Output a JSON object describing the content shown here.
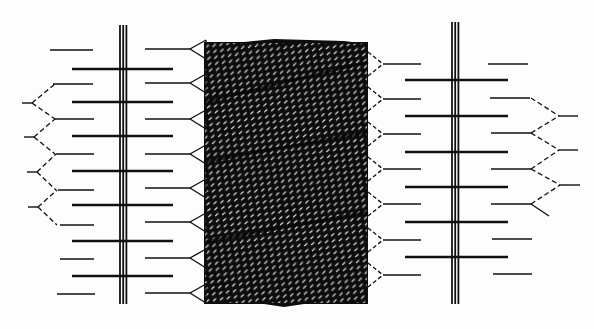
{
  "figure": {
    "width": 594,
    "height": 329,
    "background": "#fdfdfd",
    "ink": "#111111",
    "title": ""
  },
  "spines": [
    {
      "id": "left-spine",
      "x": 120,
      "gap": 3.2,
      "y1": 25,
      "y2": 304
    },
    {
      "id": "right-spine",
      "x": 452,
      "gap": 3.2,
      "y1": 22,
      "y2": 304
    }
  ],
  "core_block": {
    "x": 204,
    "y": 42,
    "width": 164,
    "height": 262,
    "fill": "#0d0d0d",
    "stripe_color": "#e6e6e6"
  },
  "left_thick_bars": {
    "x1": 72,
    "x2": 173,
    "ys": [
      69,
      102,
      136,
      171,
      205,
      241,
      276
    ]
  },
  "left_outer_thin_bars": [
    {
      "x1": 50,
      "x2": 93,
      "y": 50
    },
    {
      "x1": 53,
      "x2": 93,
      "y": 84
    },
    {
      "x1": 55,
      "x2": 94,
      "y": 119
    },
    {
      "x1": 56,
      "x2": 94,
      "y": 154
    },
    {
      "x1": 58,
      "x2": 94,
      "y": 190
    },
    {
      "x1": 60,
      "x2": 94,
      "y": 225
    },
    {
      "x1": 60,
      "x2": 94,
      "y": 259
    },
    {
      "x1": 57,
      "x2": 95,
      "y": 294
    }
  ],
  "left_inner_bars": {
    "x1": 145,
    "x2": 190,
    "ys": [
      49,
      83,
      119,
      154,
      188,
      222,
      258,
      293
    ]
  },
  "left_chevrons": [
    {
      "tip_x": 22,
      "tip_y": 103,
      "top_y": 84,
      "bot_y": 119,
      "open_x": 55
    },
    {
      "tip_x": 24,
      "tip_y": 137,
      "top_y": 119,
      "bot_y": 154,
      "open_x": 55
    },
    {
      "tip_x": 27,
      "tip_y": 172,
      "top_y": 154,
      "bot_y": 190,
      "open_x": 56
    },
    {
      "tip_x": 28,
      "tip_y": 207,
      "top_y": 190,
      "bot_y": 225,
      "open_x": 57
    }
  ],
  "right_inner_bars": {
    "x1": 383,
    "x2": 421,
    "ys": [
      64,
      99,
      134,
      169,
      204,
      240,
      275
    ]
  },
  "right_thick_bars": {
    "x1": 405,
    "x2": 508,
    "ys": [
      80,
      116,
      152,
      187,
      222,
      257
    ]
  },
  "right_outer_bars": [
    {
      "x1": 488,
      "x2": 528,
      "y": 64
    },
    {
      "x1": 490,
      "x2": 530,
      "y": 98
    },
    {
      "x1": 491,
      "x2": 531,
      "y": 133
    },
    {
      "x1": 491,
      "x2": 531,
      "y": 169
    },
    {
      "x1": 491,
      "x2": 531,
      "y": 204
    },
    {
      "x1": 492,
      "x2": 532,
      "y": 239
    },
    {
      "x1": 493,
      "x2": 532,
      "y": 274
    }
  ],
  "right_chevrons": [
    {
      "tip_x": 559,
      "tip_y": 116,
      "top_y": 98,
      "bot_y": 133,
      "open_x": 531,
      "stub_x2": 578
    },
    {
      "tip_x": 559,
      "tip_y": 150,
      "top_y": 133,
      "bot_y": 169,
      "open_x": 531,
      "stub_x2": 578
    },
    {
      "tip_x": 560,
      "tip_y": 185,
      "top_y": 169,
      "bot_y": 204,
      "open_x": 531,
      "stub_x2": 580
    }
  ],
  "right_end_fork": {
    "x": 531,
    "y": 204,
    "dx": 18,
    "dy": 12
  }
}
